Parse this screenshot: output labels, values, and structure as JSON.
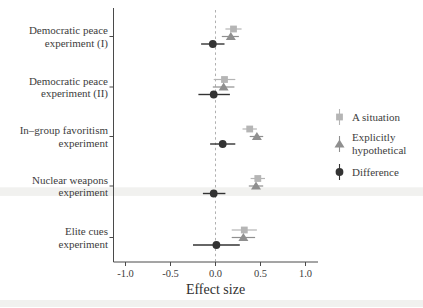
{
  "figure": {
    "background": "#ffffff",
    "axis_color": "#4a4a4a",
    "text_color": "#3d3d3d",
    "ref_line_color": "#b0b0b0",
    "stripe_color": "#f1f1ef"
  },
  "chart_data": {
    "type": "scatter",
    "subtype": "pointrange-forest-plot",
    "orientation": "horizontal",
    "title": "",
    "xlabel": "Effect size",
    "ylabel": "",
    "xlim": [
      -1.15,
      1.15
    ],
    "xticks": [
      -1.0,
      -0.5,
      0.0,
      0.5,
      1.0
    ],
    "xtick_labels": [
      "-1.0",
      "-0.5",
      "0.0",
      "0.5",
      "1.0"
    ],
    "reference_line_x": 0,
    "reference_line_style": "dashed",
    "grid": false,
    "legend_position": "right",
    "categories": [
      {
        "lines": [
          "Democratic peace",
          "experiment (I)"
        ]
      },
      {
        "lines": [
          "Democratic peace",
          "experiment (II)"
        ]
      },
      {
        "lines": [
          "In–group favoritism",
          "experiment"
        ]
      },
      {
        "lines": [
          "Nuclear weapons",
          "experiment"
        ]
      },
      {
        "lines": [
          "Elite cues",
          "experiment"
        ]
      }
    ],
    "series": [
      {
        "name": "A situation",
        "legend_lines": [
          "A situation"
        ],
        "marker": "square",
        "color": "#b5b5b5",
        "values": [
          0.2,
          0.1,
          0.38,
          0.47,
          0.32
        ],
        "ci_low": [
          0.11,
          -0.02,
          0.3,
          0.39,
          0.18
        ],
        "ci_high": [
          0.29,
          0.22,
          0.46,
          0.55,
          0.46
        ]
      },
      {
        "name": "Explicitly hypothetical",
        "legend_lines": [
          "Explicitly",
          "hypothetical"
        ],
        "marker": "triangle",
        "color": "#8f8f8f",
        "values": [
          0.17,
          0.09,
          0.46,
          0.45,
          0.31
        ],
        "ci_low": [
          0.07,
          -0.03,
          0.38,
          0.37,
          0.18
        ],
        "ci_high": [
          0.26,
          0.21,
          0.53,
          0.53,
          0.44
        ]
      },
      {
        "name": "Difference",
        "legend_lines": [
          "Difference"
        ],
        "marker": "circle",
        "color": "#333333",
        "values": [
          -0.03,
          -0.02,
          0.08,
          -0.02,
          0.01
        ],
        "ci_low": [
          -0.16,
          -0.19,
          -0.06,
          -0.14,
          -0.25
        ],
        "ci_high": [
          0.1,
          0.16,
          0.22,
          0.11,
          0.27
        ]
      }
    ]
  }
}
